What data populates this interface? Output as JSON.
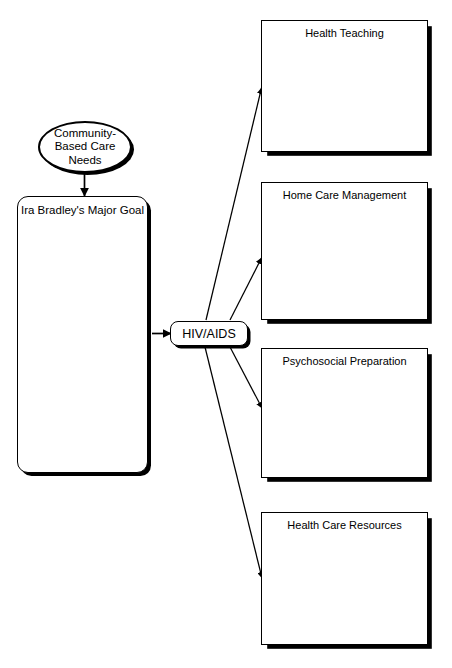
{
  "diagram": {
    "stroke_color": "#000000",
    "background_color": "#ffffff",
    "shadow_color": "#000000"
  },
  "nodes": {
    "needs_oval": {
      "label": "Community-Based Care Needs",
      "shape": "ellipse"
    },
    "goal_box": {
      "label": "Ira Bradley's Major Goal",
      "shape": "rounded-rectangle"
    },
    "center_pill": {
      "label": "HIV/AIDS",
      "shape": "rounded-rectangle"
    }
  },
  "outcomes": [
    {
      "label": "Health Teaching",
      "shape": "rectangle"
    },
    {
      "label": "Home Care Management",
      "shape": "rectangle"
    },
    {
      "label": "Psychosocial Preparation",
      "shape": "rectangle"
    },
    {
      "label": "Health Care Resources",
      "shape": "rectangle"
    }
  ],
  "edges": [
    {
      "from": "needs_oval",
      "to": "goal_box",
      "style": "solid-arrow",
      "direction": "down"
    },
    {
      "from": "goal_box",
      "to": "center_pill",
      "style": "solid-arrow",
      "direction": "right"
    },
    {
      "from": "center_pill",
      "to": "Health Teaching",
      "style": "solid-arrow",
      "direction": "up-right"
    },
    {
      "from": "center_pill",
      "to": "Home Care Management",
      "style": "solid-arrow",
      "direction": "up-right"
    },
    {
      "from": "center_pill",
      "to": "Psychosocial Preparation",
      "style": "solid-arrow",
      "direction": "down-right"
    },
    {
      "from": "center_pill",
      "to": "Health Care Resources",
      "style": "solid-arrow",
      "direction": "down-right"
    }
  ]
}
